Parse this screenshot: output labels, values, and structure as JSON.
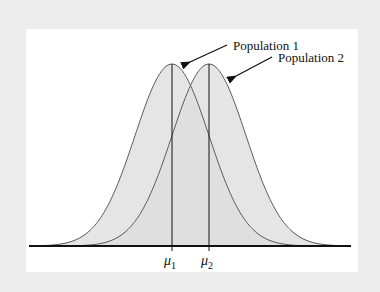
{
  "figure": {
    "labels": {
      "population_1": "Population 1",
      "population_2": "Population 2"
    },
    "axis_ticks": {
      "mu1_symbol": "μ",
      "mu1_sub": "1",
      "mu2_symbol": "μ",
      "mu2_sub": "2"
    },
    "colors": {
      "background": "#ececec",
      "panel": "#ffffff",
      "fill": "#dcdcdc",
      "curve": "#5a5a5a",
      "axis": "#111111"
    }
  },
  "chart_data": {
    "type": "area",
    "title": "",
    "xlabel": "",
    "ylabel": "",
    "series": [
      {
        "name": "Population 1",
        "distribution": "normal",
        "mean_label": "μ1",
        "mean_px": 172,
        "sigma_px": 37
      },
      {
        "name": "Population 2",
        "distribution": "normal",
        "mean_label": "μ2",
        "mean_px": 209,
        "sigma_px": 37
      }
    ],
    "x_tick_labels": [
      "μ1",
      "μ2"
    ],
    "grid": false,
    "legend": "annotations with arrows"
  }
}
